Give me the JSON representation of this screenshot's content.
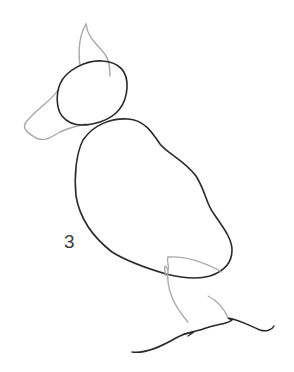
{
  "sketch": {
    "label": "3",
    "colors": {
      "primary_stroke": "#2a2a2a",
      "guide_stroke": "#a8a8a8",
      "background": "#ffffff"
    },
    "parts": [
      "ear",
      "head",
      "beak",
      "body",
      "wing-tail",
      "leg",
      "ground"
    ]
  }
}
